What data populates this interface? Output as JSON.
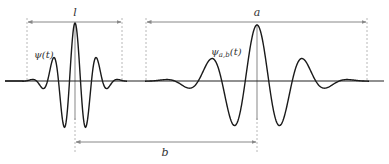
{
  "diagram": {
    "colors": {
      "curve": "#1a1a1a",
      "axis": "#222222",
      "guide": "#b0b0b0",
      "center_line": "#9a9a9a",
      "label": "#333333",
      "background": "#ffffff"
    },
    "labels": {
      "mother_wavelet": "ψ(t)",
      "daughter_wavelet_main": "ψ",
      "daughter_wavelet_sub": "a,b",
      "daughter_wavelet_arg": "(t)",
      "support_width": "l",
      "scale": "a",
      "translation": "b"
    },
    "geometry": {
      "baseline_y": 81,
      "baseline_x": [
        5,
        384
      ],
      "mother_center_x": 75,
      "daughter_center_x": 257,
      "l_bracket": {
        "x1": 27,
        "x2": 122,
        "y": 22
      },
      "a_bracket": {
        "x1": 146,
        "x2": 367,
        "y": 22
      },
      "b_bracket": {
        "x1": 75,
        "x2": 257,
        "y": 142
      }
    }
  }
}
